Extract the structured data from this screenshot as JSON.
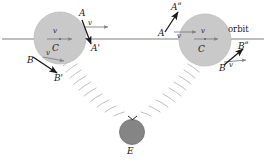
{
  "figure": {
    "colors": {
      "body_fill": "#c9c9c9",
      "body_stroke": "#b4b4b4",
      "earth_fill": "#808080",
      "earth_stroke": "#6e6e6e",
      "orbit_line": "#808080",
      "vector": "#1a1a1a",
      "ray": "#b0b0b0",
      "background": "#ffffff"
    },
    "orbit_label": "orbit"
  },
  "left_body": {
    "center_label": "C",
    "near_point_label": "A",
    "near_point_result_label": "A'",
    "far_point_label": "B",
    "far_point_result_label": "B'",
    "velocity_label_center": "v",
    "velocity_label_near": "v",
    "velocity_label_far": "v"
  },
  "right_body": {
    "center_label": "C",
    "near_point_label": "A",
    "near_point_result_label": "Aʺ",
    "far_point_label": "B",
    "far_point_result_label": "Bʺ",
    "velocity_label_center": "v",
    "velocity_label_near": "v",
    "velocity_label_far": "v"
  },
  "earth": {
    "label": "E"
  }
}
